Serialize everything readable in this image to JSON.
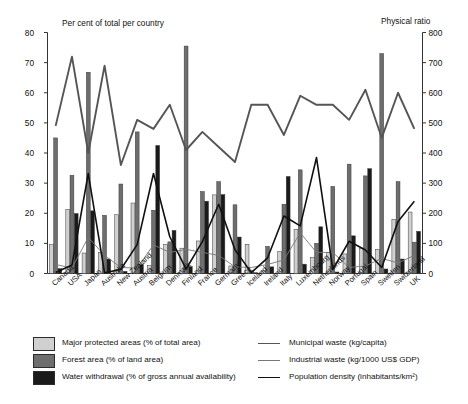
{
  "axes": {
    "left_title": "Per cent of total per country",
    "right_title": "Physical ratio",
    "left_ticks": [
      "0",
      "10",
      "20",
      "30",
      "40",
      "50",
      "60",
      "70",
      "80"
    ],
    "right_ticks": [
      "0",
      "100",
      "200",
      "300",
      "400",
      "500",
      "600",
      "700",
      "800"
    ]
  },
  "legend": {
    "bars": [
      {
        "label": "Major protected areas (% of total area)",
        "color": "#d0d0d0"
      },
      {
        "label": "Forest area (% of land area)",
        "color": "#6e6e6e"
      },
      {
        "label": "Water withdrawal (% of gross annual availability)",
        "color": "#1a1a1a"
      }
    ],
    "lines": [
      {
        "label": "Municipal waste (kg/capita)",
        "color": "#555555",
        "width": 1.9
      },
      {
        "label": "Industrial waste (kg/1000 US$ GDP)",
        "color": "#777777",
        "width": 0.9
      },
      {
        "label": "Population density (inhabitants/km²)",
        "color": "#111111",
        "width": 1.6
      }
    ]
  },
  "chart_data": {
    "type": "bar",
    "title": "",
    "xlabel": "",
    "ylabel": "Per cent of total per country",
    "y2label": "Physical ratio",
    "ylim": [
      0,
      80
    ],
    "y2lim": [
      0,
      800
    ],
    "grid": false,
    "legend_position": "bottom",
    "categories": [
      "Canada",
      "USA",
      "Japan",
      "Australia",
      "New Zealand",
      "Austria",
      "Belgium",
      "Denmark",
      "Finland",
      "France",
      "Germany",
      "Greece",
      "Iceland",
      "Ireland",
      "Italy",
      "Luxembourg",
      "Netherlands",
      "Norway",
      "Portugal",
      "Spain",
      "Sweden",
      "Switzerland",
      "UK"
    ],
    "series": [
      {
        "name": "Major protected areas (% of total area)",
        "axis": "left",
        "kind": "bar",
        "values": [
          9.6,
          21.3,
          6.8,
          7.0,
          19.5,
          23.4,
          2.6,
          9.6,
          8.4,
          10.8,
          26.1,
          2.5,
          9.7,
          0.9,
          7.3,
          14.6,
          5.4,
          6.9,
          6.5,
          8.4,
          8.0,
          18.0,
          20.4
        ]
      },
      {
        "name": "Forest area (% of land area)",
        "axis": "left",
        "kind": "bar",
        "values": [
          45.0,
          32.6,
          66.8,
          19.3,
          29.7,
          47.0,
          21.0,
          10.5,
          75.5,
          27.2,
          30.5,
          22.8,
          1.0,
          9.0,
          23.0,
          34.4,
          10.0,
          28.9,
          36.3,
          32.4,
          73.0,
          30.5,
          10.4
        ]
      },
      {
        "name": "Water withdrawal (% of gross annual availability)",
        "axis": "left",
        "kind": "bar",
        "values": [
          1.6,
          19.9,
          20.8,
          4.8,
          0.7,
          3.0,
          42.5,
          14.3,
          2.3,
          24.0,
          26.2,
          12.1,
          0.1,
          2.2,
          32.2,
          3.1,
          15.5,
          0.5,
          12.5,
          34.8,
          1.5,
          4.8,
          14.0
        ]
      }
    ],
    "lines": [
      {
        "name": "Municipal waste (kg/capita)",
        "axis": "right",
        "unit": "kg/capita",
        "values": [
          490,
          720,
          400,
          690,
          360,
          510,
          480,
          560,
          410,
          470,
          420,
          370,
          560,
          560,
          460,
          590,
          560,
          560,
          510,
          610,
          450,
          600,
          480
        ]
      },
      {
        "name": "Industrial waste (kg/1000 US$ GDP)",
        "axis": "right",
        "unit": "kg/1000 US$ GDP",
        "values": [
          30,
          18,
          120,
          60,
          20,
          18,
          95,
          70,
          80,
          70,
          60,
          22,
          20,
          30,
          45,
          135,
          70,
          70,
          20,
          25,
          50,
          35,
          60
        ]
      },
      {
        "name": "Population density (inhabitants/km²)",
        "axis": "right",
        "unit": "inhabitants/km²",
        "values": [
          3,
          28,
          332,
          2,
          14,
          96,
          332,
          122,
          15,
          106,
          230,
          79,
          3,
          52,
          191,
          158,
          385,
          14,
          107,
          78,
          20,
          173,
          240
        ]
      }
    ]
  }
}
